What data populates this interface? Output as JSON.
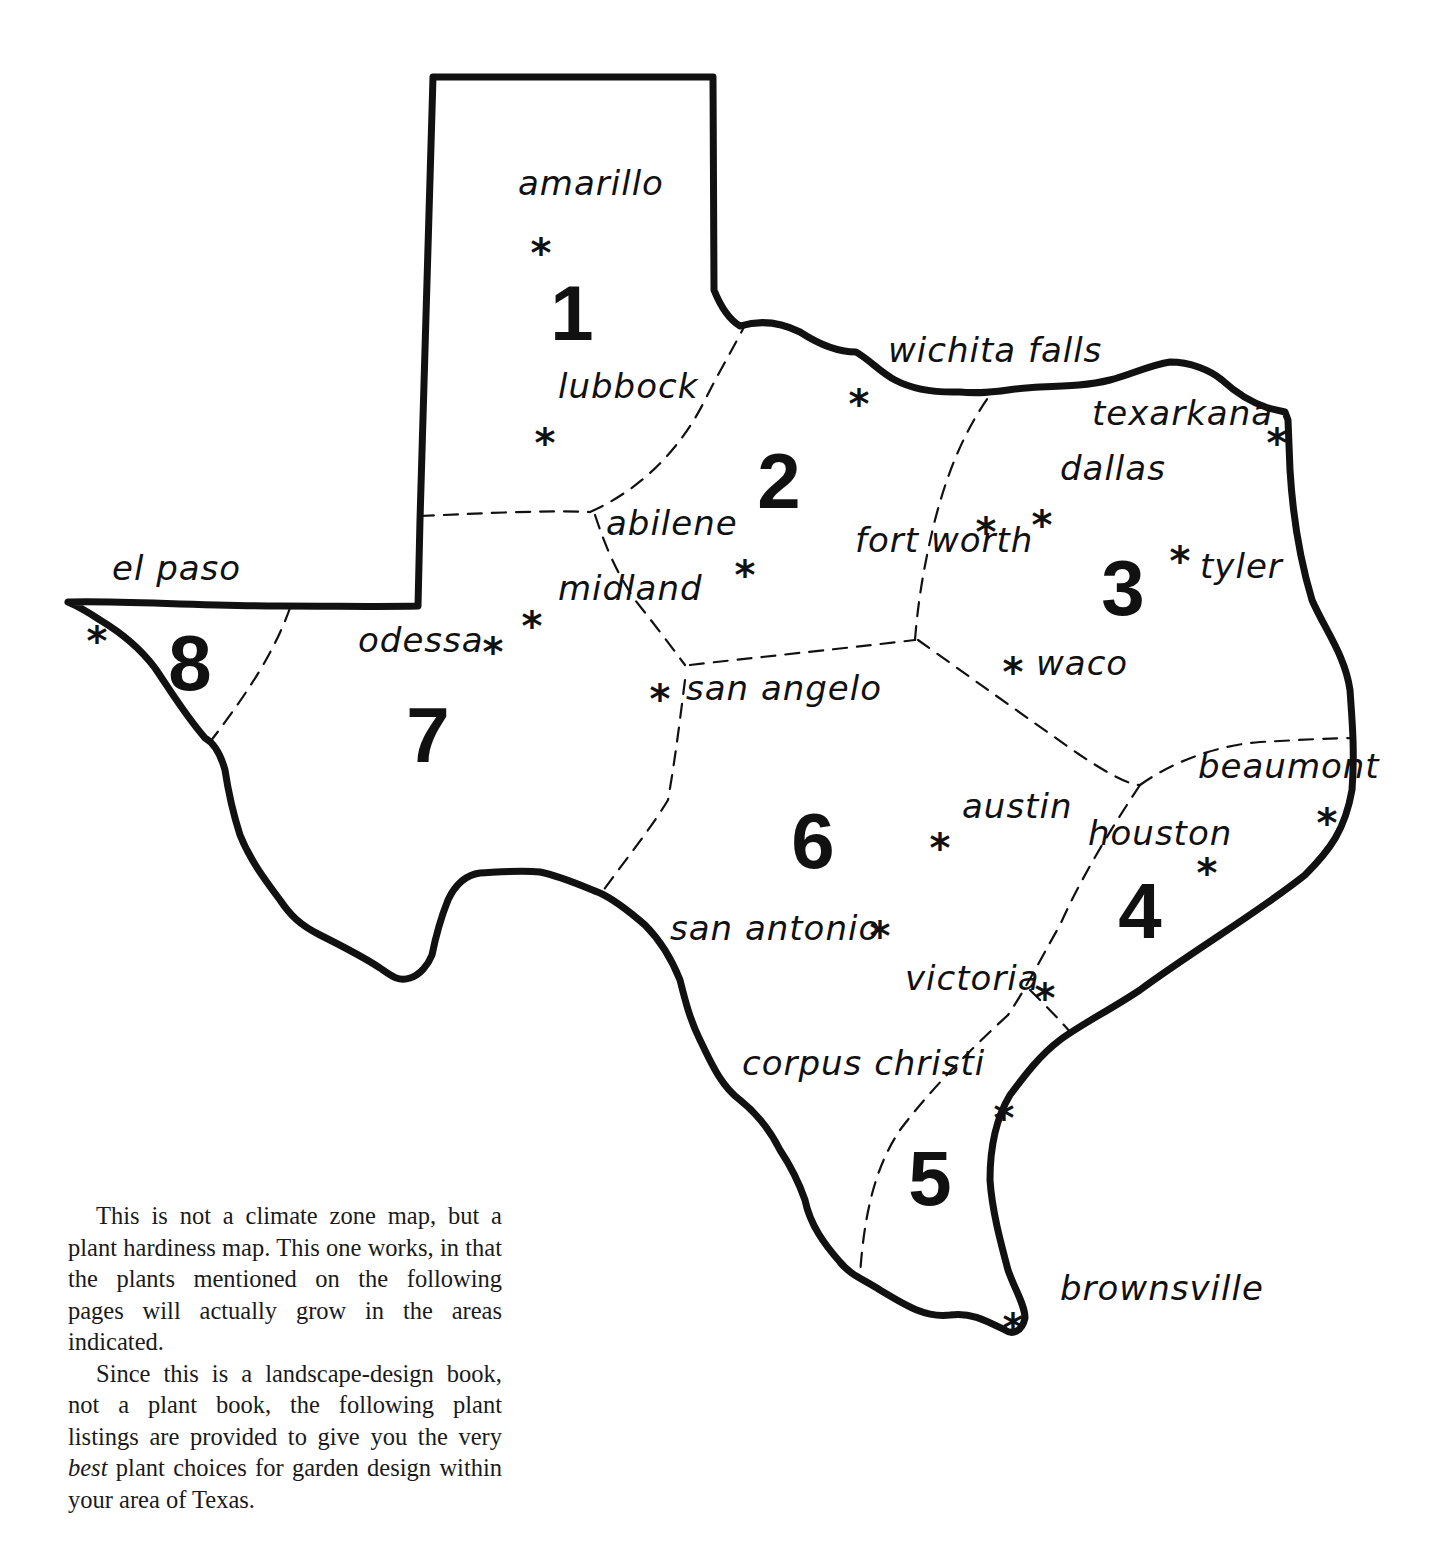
{
  "map": {
    "region": "Texas",
    "zones": [
      {
        "id": "1",
        "label": "1",
        "x": 572,
        "y": 340
      },
      {
        "id": "2",
        "label": "2",
        "x": 779,
        "y": 508
      },
      {
        "id": "3",
        "label": "3",
        "x": 1123,
        "y": 615
      },
      {
        "id": "4",
        "label": "4",
        "x": 1140,
        "y": 938
      },
      {
        "id": "5",
        "label": "5",
        "x": 930,
        "y": 1205
      },
      {
        "id": "6",
        "label": "6",
        "x": 813,
        "y": 868
      },
      {
        "id": "7",
        "label": "7",
        "x": 428,
        "y": 762
      },
      {
        "id": "8",
        "label": "8",
        "x": 190,
        "y": 690
      }
    ],
    "cities": [
      {
        "name": "amarillo",
        "zone": "1",
        "label_x": 518,
        "label_y": 195,
        "star_x": 541,
        "star_y": 245
      },
      {
        "name": "lubbock",
        "zone": "1",
        "label_x": 558,
        "label_y": 398,
        "star_x": 545,
        "star_y": 435
      },
      {
        "name": "wichita falls",
        "zone": "2",
        "label_x": 888,
        "label_y": 362,
        "star_x": 859,
        "star_y": 396
      },
      {
        "name": "abilene",
        "zone": "2",
        "label_x": 606,
        "label_y": 535,
        "star_x": 745,
        "star_y": 567
      },
      {
        "name": "midland",
        "zone": "7",
        "label_x": 558,
        "label_y": 600,
        "star_x": 532,
        "star_y": 618
      },
      {
        "name": "odessa",
        "zone": "7",
        "label_x": 358,
        "label_y": 652,
        "star_x": 493,
        "star_y": 644
      },
      {
        "name": "el paso",
        "zone": "8",
        "label_x": 112,
        "label_y": 580,
        "star_x": 97,
        "star_y": 633
      },
      {
        "name": "san angelo",
        "zone": "6",
        "label_x": 686,
        "label_y": 700,
        "star_x": 660,
        "star_y": 691
      },
      {
        "name": "fort worth",
        "zone": "3",
        "label_x": 855,
        "label_y": 552,
        "star_x": 986,
        "star_y": 524
      },
      {
        "name": "dallas",
        "zone": "3",
        "label_x": 1060,
        "label_y": 480,
        "star_x": 1042,
        "star_y": 517
      },
      {
        "name": "texarkana",
        "zone": "3",
        "label_x": 1092,
        "label_y": 425,
        "star_x": 1277,
        "star_y": 435
      },
      {
        "name": "tyler",
        "zone": "3",
        "label_x": 1200,
        "label_y": 578,
        "star_x": 1180,
        "star_y": 553
      },
      {
        "name": "waco",
        "zone": "3",
        "label_x": 1036,
        "label_y": 675,
        "star_x": 1013,
        "star_y": 664
      },
      {
        "name": "beaumont",
        "zone": "4",
        "label_x": 1198,
        "label_y": 778,
        "star_x": 1327,
        "star_y": 815
      },
      {
        "name": "houston",
        "zone": "4",
        "label_x": 1088,
        "label_y": 845,
        "star_x": 1207,
        "star_y": 865
      },
      {
        "name": "austin",
        "zone": "6",
        "label_x": 962,
        "label_y": 818,
        "star_x": 940,
        "star_y": 840
      },
      {
        "name": "san antonio",
        "zone": "6",
        "label_x": 670,
        "label_y": 940,
        "star_x": 880,
        "star_y": 928
      },
      {
        "name": "victoria",
        "zone": "5",
        "label_x": 905,
        "label_y": 990,
        "star_x": 1045,
        "star_y": 990
      },
      {
        "name": "corpus christi",
        "zone": "5",
        "label_x": 742,
        "label_y": 1075,
        "star_x": 1004,
        "star_y": 1110
      },
      {
        "name": "brownsville",
        "zone": "5",
        "label_x": 1060,
        "label_y": 1300,
        "star_x": 1013,
        "star_y": 1320
      }
    ],
    "marker_glyph": "*",
    "outline_color": "#111111",
    "background_color": "#ffffff"
  },
  "caption": {
    "paragraph_1": "This is not a climate zone map, but a plant hardiness map. This one works, in that the plants mentioned on the following pages will actually grow in the areas indicated.",
    "paragraph_2_before": "Since this is a landscape-design book, not a plant book, the following plant listings are provided to give you the very ",
    "paragraph_2_emphasis": "best",
    "paragraph_2_after": " plant choices for garden design within your area of Texas."
  }
}
